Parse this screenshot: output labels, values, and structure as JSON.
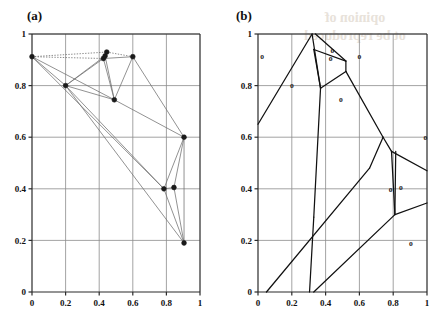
{
  "figure": {
    "width": 447,
    "height": 325,
    "background": "#ffffff",
    "ink_color": "#1a1a1a",
    "grid_color": "#8c8c8c",
    "axis_color": "#2b2b2b",
    "edge_color": "#6e6e6e",
    "cell_color": "#111111"
  },
  "panels": [
    {
      "id": "panel-a",
      "label": "(a)",
      "label_x": 27,
      "label_y": 20,
      "plot": {
        "left": 32,
        "right": 200,
        "top": 34,
        "bottom": 292
      },
      "axis": {
        "xlim": [
          0,
          1
        ],
        "ylim": [
          0,
          1
        ],
        "xticks": [
          0,
          0.2,
          0.4,
          0.6,
          0.8,
          1
        ],
        "yticks": [
          0,
          0.2,
          0.4,
          0.6,
          0.8,
          1
        ],
        "xticklabels": [
          "0",
          "0.2",
          "0.4",
          "0.6",
          "0.8",
          "1"
        ],
        "yticklabels": [
          "0",
          "0.2",
          "0.4",
          "0.6",
          "0.8",
          "1"
        ],
        "grid": true
      }
    },
    {
      "id": "panel-b",
      "label": "(b)",
      "label_x": 236,
      "label_y": 20,
      "plot": {
        "left": 258,
        "right": 427,
        "top": 34,
        "bottom": 292
      },
      "axis": {
        "xlim": [
          0,
          1
        ],
        "ylim": [
          0,
          1
        ],
        "xticks": [
          0,
          0.2,
          0.4,
          0.6,
          0.8,
          1
        ],
        "yticks": [
          0,
          0.2,
          0.4,
          0.6,
          0.8,
          1
        ],
        "xticklabels": [
          "0",
          "0.2",
          "0.4",
          "0.6",
          "0.8",
          "1"
        ],
        "yticklabels": [
          "0",
          "0.2",
          "0.4",
          "0.6",
          "0.8",
          "1"
        ],
        "grid": true
      }
    }
  ],
  "chart_data": [
    {
      "type": "scatter",
      "id": "delaunay-graph",
      "panel": "panel-a",
      "title": "(a)",
      "xlabel": "",
      "ylabel": "",
      "xlim": [
        0,
        1
      ],
      "ylim": [
        0,
        1
      ],
      "grid": true,
      "marker": "filled-circle",
      "nodes": [
        {
          "id": "n0",
          "x": 0.0,
          "y": 0.912
        },
        {
          "id": "n1",
          "x": 0.2,
          "y": 0.8
        },
        {
          "id": "n2",
          "x": 0.425,
          "y": 0.905
        },
        {
          "id": "n3",
          "x": 0.445,
          "y": 0.93
        },
        {
          "id": "n4",
          "x": 0.435,
          "y": 0.915
        },
        {
          "id": "n5",
          "x": 0.6,
          "y": 0.912
        },
        {
          "id": "n6",
          "x": 0.49,
          "y": 0.745
        },
        {
          "id": "n7",
          "x": 0.905,
          "y": 0.6
        },
        {
          "id": "n8",
          "x": 0.785,
          "y": 0.4
        },
        {
          "id": "n9",
          "x": 0.845,
          "y": 0.405
        },
        {
          "id": "n10",
          "x": 0.905,
          "y": 0.19
        }
      ],
      "solid_edges": [
        [
          "n0",
          "n1"
        ],
        [
          "n0",
          "n6"
        ],
        [
          "n0",
          "n8"
        ],
        [
          "n1",
          "n2"
        ],
        [
          "n1",
          "n4"
        ],
        [
          "n1",
          "n6"
        ],
        [
          "n1",
          "n8"
        ],
        [
          "n1",
          "n10"
        ],
        [
          "n2",
          "n5"
        ],
        [
          "n2",
          "n6"
        ],
        [
          "n4",
          "n6"
        ],
        [
          "n5",
          "n6"
        ],
        [
          "n5",
          "n7"
        ],
        [
          "n6",
          "n7"
        ],
        [
          "n7",
          "n8"
        ],
        [
          "n7",
          "n9"
        ],
        [
          "n7",
          "n10"
        ],
        [
          "n8",
          "n9"
        ],
        [
          "n8",
          "n10"
        ],
        [
          "n9",
          "n10"
        ]
      ],
      "dotted_edges": [
        [
          "n0",
          "n3"
        ],
        [
          "n3",
          "n5"
        ],
        [
          "n2",
          "n3"
        ],
        [
          "n0",
          "n2"
        ]
      ]
    },
    {
      "type": "scatter",
      "id": "voronoi-diagram",
      "panel": "panel-b",
      "title": "(b)",
      "xlabel": "",
      "ylabel": "",
      "xlim": [
        0,
        1
      ],
      "ylim": [
        0,
        1
      ],
      "grid": true,
      "marker": "o",
      "sites": [
        {
          "id": "s0",
          "x": 0.025,
          "y": 0.912,
          "label": "o"
        },
        {
          "id": "s1",
          "x": 0.2,
          "y": 0.8,
          "label": "o"
        },
        {
          "id": "s2",
          "x": 0.44,
          "y": 0.935,
          "label": "o"
        },
        {
          "id": "s3",
          "x": 0.43,
          "y": 0.905,
          "label": "o"
        },
        {
          "id": "s4",
          "x": 0.6,
          "y": 0.912,
          "label": "o"
        },
        {
          "id": "s5",
          "x": 0.49,
          "y": 0.745,
          "label": "o"
        },
        {
          "id": "s6",
          "x": 0.99,
          "y": 0.6,
          "label": "o"
        },
        {
          "id": "s7",
          "x": 0.785,
          "y": 0.4,
          "label": "o"
        },
        {
          "id": "s8",
          "x": 0.845,
          "y": 0.405,
          "label": "o"
        },
        {
          "id": "s9",
          "x": 0.905,
          "y": 0.19,
          "label": "o"
        }
      ],
      "cell_boundaries": [
        [
          [
            0.0,
            0.65
          ],
          [
            0.32,
            1.0
          ]
        ],
        [
          [
            0.32,
            1.0
          ],
          [
            0.37,
            0.79
          ]
        ],
        [
          [
            0.37,
            0.79
          ],
          [
            0.33,
            0.29
          ]
        ],
        [
          [
            0.33,
            0.29
          ],
          [
            0.305,
            0.0
          ]
        ],
        [
          [
            0.33,
            0.94
          ],
          [
            0.52,
            0.895
          ]
        ],
        [
          [
            0.33,
            0.94
          ],
          [
            0.37,
            0.79
          ]
        ],
        [
          [
            0.52,
            0.895
          ],
          [
            0.52,
            0.855
          ]
        ],
        [
          [
            0.52,
            0.855
          ],
          [
            0.37,
            0.79
          ]
        ],
        [
          [
            0.52,
            0.855
          ],
          [
            0.74,
            0.6
          ]
        ],
        [
          [
            0.74,
            0.6
          ],
          [
            0.79,
            0.545
          ]
        ],
        [
          [
            0.79,
            0.545
          ],
          [
            1.0,
            0.47
          ]
        ],
        [
          [
            0.74,
            0.6
          ],
          [
            0.66,
            0.48
          ]
        ],
        [
          [
            0.66,
            0.48
          ],
          [
            0.05,
            0.0
          ]
        ],
        [
          [
            0.79,
            0.545
          ],
          [
            0.81,
            0.3
          ]
        ],
        [
          [
            0.81,
            0.3
          ],
          [
            1.0,
            0.345
          ]
        ],
        [
          [
            0.81,
            0.3
          ],
          [
            0.33,
            0.0
          ]
        ],
        [
          [
            0.34,
            1.0
          ],
          [
            0.52,
            0.895
          ]
        ],
        [
          [
            0.815,
            0.545
          ],
          [
            0.81,
            0.3
          ]
        ]
      ]
    }
  ],
  "watermark": {
    "line1": "opinion of",
    "line2": "ot be reproduced",
    "visible": true
  }
}
